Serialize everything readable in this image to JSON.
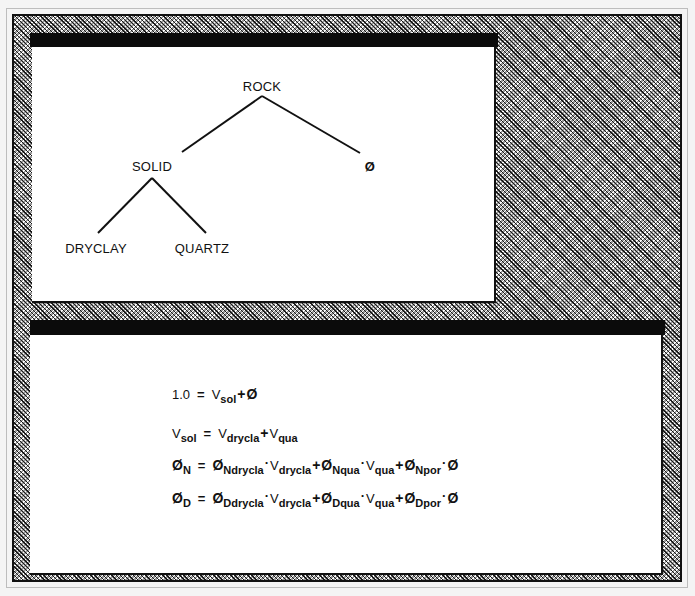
{
  "tree_window": {
    "title": "",
    "nodes": {
      "root": "ROCK",
      "solid": "SOLID",
      "porosity": "Ø",
      "dryclay": "DRYCLAY",
      "quartz": "QUARTZ"
    },
    "edges": [
      [
        "ROCK",
        "SOLID"
      ],
      [
        "ROCK",
        "Ø"
      ],
      [
        "SOLID",
        "DRYCLAY"
      ],
      [
        "SOLID",
        "QUARTZ"
      ]
    ]
  },
  "equations_window": {
    "title": "",
    "equations": [
      {
        "lhs": "1.0",
        "eq": "=",
        "terms": [
          {
            "sym": "V",
            "sub": "sol"
          },
          {
            "op": "+"
          },
          {
            "sym": "Ø"
          }
        ]
      },
      {
        "lhs_sym": "V",
        "lhs_sub": "sol",
        "eq": "=",
        "terms": [
          {
            "sym": "V",
            "sub": "drycla"
          },
          {
            "op": "+"
          },
          {
            "sym": "V",
            "sub": "qua"
          }
        ]
      },
      {
        "lhs_sym": "Ø",
        "lhs_sub": "N",
        "eq": "=",
        "terms": [
          {
            "sym": "Ø",
            "sub": "Ndrycla"
          },
          {
            "op": "·"
          },
          {
            "sym": "V",
            "sub": "drycla"
          },
          {
            "op": "+"
          },
          {
            "sym": "Ø",
            "sub": "Nqua"
          },
          {
            "op": "·"
          },
          {
            "sym": "V",
            "sub": "qua"
          },
          {
            "op": "+"
          },
          {
            "sym": "Ø",
            "sub": "Npor"
          },
          {
            "op": "·"
          },
          {
            "sym": "Ø"
          }
        ]
      },
      {
        "lhs_sym": "Ø",
        "lhs_sub": "D",
        "eq": "=",
        "terms": [
          {
            "sym": "Ø",
            "sub": "Ddrycla"
          },
          {
            "op": "·"
          },
          {
            "sym": "V",
            "sub": "drycla"
          },
          {
            "op": "+"
          },
          {
            "sym": "Ø",
            "sub": "Dqua"
          },
          {
            "op": "·"
          },
          {
            "sym": "V",
            "sub": "qua"
          },
          {
            "op": "+"
          },
          {
            "sym": "Ø",
            "sub": "Dpor"
          },
          {
            "op": "·"
          },
          {
            "sym": "Ø"
          }
        ]
      }
    ]
  },
  "glyphs": {
    "eq": "=",
    "plus": "+",
    "dot": "·",
    "phi": "Ø",
    "V": "V",
    "one": "1.0"
  },
  "colors": {
    "titlebar": "#0b0b0b",
    "content": "#ffffff",
    "desktop_dither": "#9a9a9a"
  }
}
